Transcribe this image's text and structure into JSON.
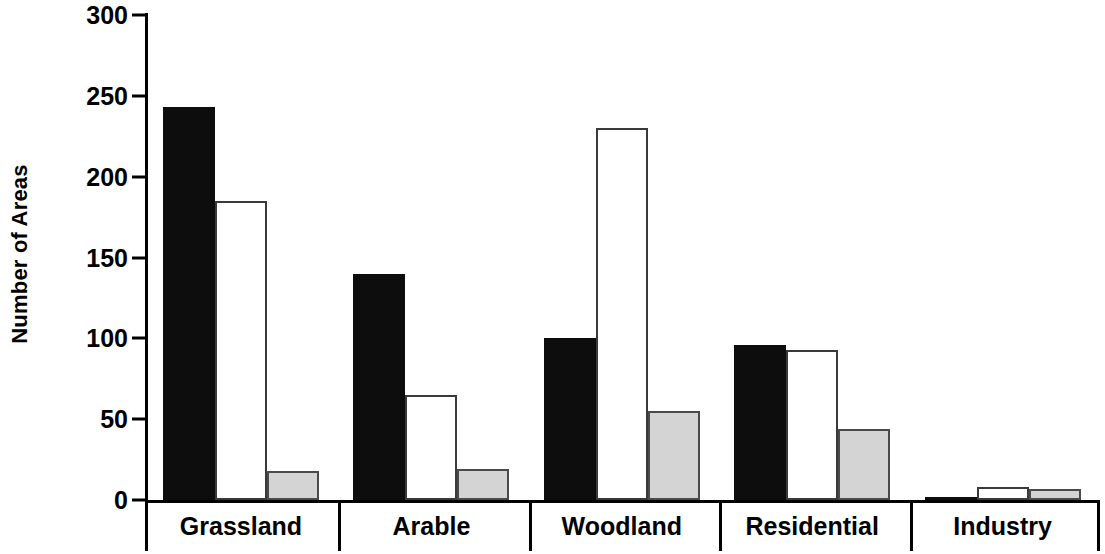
{
  "chart_data": {
    "type": "bar",
    "title": "",
    "subtitle": "",
    "xlabel": "",
    "ylabel": "Number of Areas",
    "ylim": [
      0,
      300
    ],
    "yticks": [
      0,
      50,
      100,
      150,
      200,
      250,
      300
    ],
    "ytick_labels": [
      "0",
      "50",
      "100",
      "150",
      "200",
      "250",
      "300"
    ],
    "grid": false,
    "legend": null,
    "legend_position": "none",
    "categories": [
      "Grassland",
      "Arable",
      "Woodland",
      "Residential",
      "Industry"
    ],
    "series": [
      {
        "name": "series-1-filled",
        "style": "filled-black",
        "color": "#0d0d0d",
        "values": [
          243,
          140,
          100,
          96,
          2
        ]
      },
      {
        "name": "series-2-open",
        "style": "open-white",
        "color": "#ffffff",
        "values": [
          185,
          65,
          230,
          93,
          8
        ]
      },
      {
        "name": "series-3-shaded",
        "style": "shaded-grey",
        "color": "#d4d4d4",
        "values": [
          18,
          19,
          55,
          44,
          7
        ]
      }
    ]
  },
  "axis": {
    "y_title": "Number of Areas"
  },
  "colors": {
    "filled": "#0d0d0d",
    "open_fill": "#ffffff",
    "open_stroke": "#3a3a3a",
    "shaded_fill": "#d4d4d4",
    "shaded_stroke": "#4a4a4a",
    "axis": "#000000",
    "background": "#ffffff"
  }
}
